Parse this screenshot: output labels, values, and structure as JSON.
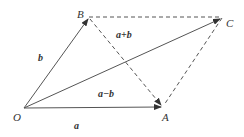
{
  "diagram": {
    "title": "",
    "points": {
      "O": {
        "label": "O",
        "x": 24,
        "y": 108,
        "lx": 13,
        "ly": 121
      },
      "A": {
        "label": "A",
        "x": 163,
        "y": 107,
        "lx": 162,
        "ly": 121
      },
      "B": {
        "label": "B",
        "x": 89,
        "y": 17,
        "lx": 77,
        "ly": 18
      },
      "C": {
        "label": "C",
        "x": 222,
        "y": 18,
        "lx": 226,
        "ly": 27
      }
    },
    "vector_labels": {
      "a": {
        "text": "a",
        "x": 74,
        "y": 129
      },
      "b": {
        "text": "b",
        "x": 38,
        "y": 61
      },
      "a_plus_b": {
        "text": "a+b",
        "x": 116,
        "y": 38
      },
      "a_minus_b": {
        "text": "a−b",
        "x": 98,
        "y": 97
      }
    },
    "colors": {
      "line": "#555555",
      "text": "#333333"
    }
  }
}
